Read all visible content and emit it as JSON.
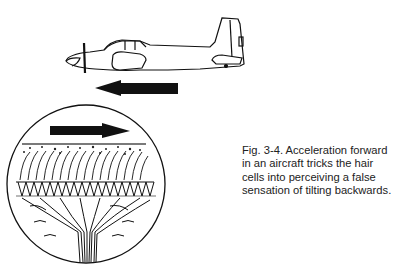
{
  "figure": {
    "caption_lines": [
      "Fig. 3-4. Acceleration forward",
      "in an aircraft tricks the hair",
      "cells into perceiving a false",
      "sensation of tilting backwards."
    ],
    "illustrations": {
      "aircraft": "side-view single-engine airplane with propeller, facing left",
      "aircraft_arrow": "arrow pointing left (direction of acceleration)",
      "inset": "circular magnified view of vestibular hair cells",
      "inset_arrow": "arrow pointing right (perceived displacement)"
    },
    "colors": {
      "ink": "#111111",
      "background": "#ffffff"
    }
  }
}
